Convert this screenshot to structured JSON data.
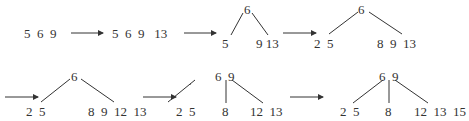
{
  "diagram": {
    "type": "btree-insertion-sequence",
    "stroke_color": "#333333",
    "steps": [
      {
        "id": "s1",
        "kind": "list",
        "keys": "5  6  9"
      },
      {
        "id": "s2",
        "kind": "list",
        "keys": "5  6  9   13"
      },
      {
        "id": "s3",
        "kind": "tree",
        "root": "6",
        "leaves": [
          "5",
          "9 13"
        ]
      },
      {
        "id": "s4",
        "kind": "tree",
        "root": "6",
        "leaves": [
          "2  5",
          "8  9  13"
        ]
      },
      {
        "id": "s5",
        "kind": "tree",
        "root": "6",
        "leaves": [
          "2  5",
          "8  9  12  13"
        ]
      },
      {
        "id": "s6",
        "kind": "tree",
        "root": "6  9",
        "leaves": [
          "2  5",
          "8",
          "12  13"
        ]
      },
      {
        "id": "s7",
        "kind": "tree",
        "root": "6  9",
        "leaves": [
          "2  5",
          "8",
          "12  13  15"
        ]
      }
    ]
  }
}
